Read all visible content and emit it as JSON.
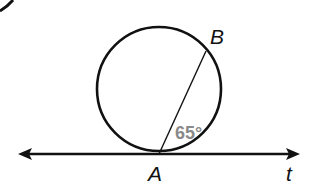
{
  "diagram": {
    "labels": {
      "point_a": "A",
      "point_b": "B",
      "line_t": "t",
      "angle": "65°"
    },
    "colors": {
      "stroke": "#111111",
      "angle_label": "#8a8a8a",
      "background": "#ffffff"
    }
  }
}
